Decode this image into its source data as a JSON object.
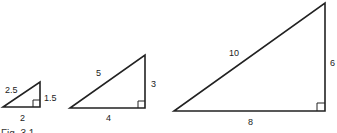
{
  "figure": {
    "caption": "Fig. 3.1",
    "triangles": [
      {
        "id": "small",
        "vertices": {
          "left": [
            3,
            107
          ],
          "right_angle": [
            40,
            107
          ],
          "top": [
            40,
            82
          ]
        },
        "labels": {
          "hypotenuse": {
            "text": "2.5",
            "pos": [
              5,
              93
            ]
          },
          "vertical": {
            "text": "1.5",
            "pos": [
              44,
              100
            ]
          },
          "base": {
            "text": "2",
            "pos": [
              19,
              120
            ]
          }
        }
      },
      {
        "id": "medium",
        "vertices": {
          "left": [
            70,
            108
          ],
          "right_angle": [
            145,
            108
          ],
          "top": [
            145,
            55
          ]
        },
        "labels": {
          "hypotenuse": {
            "text": "5",
            "pos": [
              96,
              76
            ]
          },
          "vertical": {
            "text": "3",
            "pos": [
              151,
              87
            ]
          },
          "base": {
            "text": "4",
            "pos": [
              105,
              120
            ]
          }
        }
      },
      {
        "id": "large",
        "vertices": {
          "left": [
            174,
            111
          ],
          "right_angle": [
            325,
            111
          ],
          "top": [
            325,
            3
          ]
        },
        "labels": {
          "hypotenuse": {
            "text": "10",
            "pos": [
              230,
              56
            ]
          },
          "vertical": {
            "text": "6",
            "pos": [
              330,
              65
            ]
          },
          "base": {
            "text": "8",
            "pos": [
              248,
              124
            ]
          }
        }
      }
    ]
  }
}
